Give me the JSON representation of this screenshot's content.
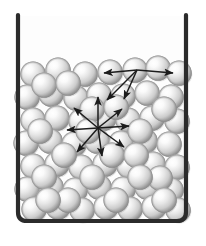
{
  "figure": {
    "width": 206,
    "height": 246,
    "background_color": "#ffffff"
  },
  "container": {
    "name": "beaker",
    "shape": "u-shaped-open-top",
    "stroke_color": "#2b2b2b",
    "stroke_width": 4.2,
    "corner_radius": 9,
    "left_wall_x": 18,
    "right_wall_x": 186,
    "top_y": 15,
    "bottom_y": 221,
    "interior_fill": "#fdfdfd"
  },
  "molecules": {
    "name": "sphere-molecules",
    "count": 67,
    "radius": 12.6,
    "highlight_color": "#fbfbfb",
    "mid_color": "#dcdcdc",
    "edge_color": "#8e8e8e",
    "shadow_color": "#9a9a9a",
    "highlight_offset_x": -0.32,
    "highlight_offset_y": -0.34,
    "positions": [
      [
        33,
        74
      ],
      [
        58,
        70
      ],
      [
        85,
        74
      ],
      [
        110,
        72
      ],
      [
        135,
        70
      ],
      [
        158,
        68
      ],
      [
        179,
        73
      ],
      [
        27,
        97
      ],
      [
        51,
        94
      ],
      [
        76,
        98
      ],
      [
        99,
        95
      ],
      [
        123,
        96
      ],
      [
        147,
        93
      ],
      [
        171,
        97
      ],
      [
        33,
        120
      ],
      [
        57,
        118
      ],
      [
        81,
        121
      ],
      [
        104,
        118
      ],
      [
        128,
        120
      ],
      [
        152,
        118
      ],
      [
        177,
        121
      ],
      [
        26,
        143
      ],
      [
        50,
        141
      ],
      [
        74,
        144
      ],
      [
        97,
        141
      ],
      [
        121,
        143
      ],
      [
        145,
        141
      ],
      [
        169,
        144
      ],
      [
        33,
        166
      ],
      [
        57,
        164
      ],
      [
        81,
        167
      ],
      [
        105,
        164
      ],
      [
        129,
        166
      ],
      [
        153,
        164
      ],
      [
        177,
        167
      ],
      [
        27,
        189
      ],
      [
        51,
        187
      ],
      [
        75,
        190
      ],
      [
        99,
        187
      ],
      [
        123,
        189
      ],
      [
        147,
        187
      ],
      [
        171,
        190
      ],
      [
        34,
        209
      ],
      [
        58,
        207
      ],
      [
        82,
        210
      ],
      [
        106,
        207
      ],
      [
        130,
        209
      ],
      [
        154,
        207
      ],
      [
        178,
        210
      ],
      [
        44,
        85
      ],
      [
        68,
        83
      ],
      [
        92,
        109
      ],
      [
        116,
        107
      ],
      [
        140,
        131
      ],
      [
        164,
        109
      ],
      [
        40,
        131
      ],
      [
        64,
        155
      ],
      [
        88,
        131
      ],
      [
        112,
        155
      ],
      [
        136,
        155
      ],
      [
        160,
        178
      ],
      [
        44,
        177
      ],
      [
        68,
        200
      ],
      [
        92,
        177
      ],
      [
        116,
        200
      ],
      [
        140,
        177
      ],
      [
        164,
        200
      ],
      [
        48,
        200
      ]
    ]
  },
  "vectors": {
    "name": "motion-arrows",
    "stroke_color": "#1c1c1c",
    "stroke_width": 1.5,
    "arrowhead_length": 5.5,
    "arrowhead_width": 4,
    "groups": [
      {
        "name": "zigzag-path-upper",
        "label": "translational motion path",
        "vertex": [
          137,
          70
        ],
        "arrows": [
          {
            "from": [
              137,
              70
            ],
            "to": [
              104,
              73
            ]
          },
          {
            "from": [
              137,
              70
            ],
            "to": [
              173,
              73
            ]
          },
          {
            "from": [
              137,
              70
            ],
            "to": [
              107,
              100
            ]
          },
          {
            "from": [
              137,
              70
            ],
            "to": [
              124,
              99
            ]
          }
        ]
      },
      {
        "name": "radial-burst-center",
        "label": "random molecular motion",
        "center": [
          98,
          128
        ],
        "arrows": [
          {
            "from": [
              98,
              128
            ],
            "to": [
              98,
              97
            ]
          },
          {
            "from": [
              98,
              128
            ],
            "to": [
              122,
              109
            ]
          },
          {
            "from": [
              98,
              128
            ],
            "to": [
              129,
              126
            ]
          },
          {
            "from": [
              98,
              128
            ],
            "to": [
              124,
              147
            ]
          },
          {
            "from": [
              98,
              128
            ],
            "to": [
              102,
              156
            ]
          },
          {
            "from": [
              98,
              128
            ],
            "to": [
              77,
              152
            ]
          },
          {
            "from": [
              98,
              128
            ],
            "to": [
              67,
              130
            ]
          },
          {
            "from": [
              98,
              128
            ],
            "to": [
              74,
              108
            ]
          }
        ]
      }
    ]
  }
}
